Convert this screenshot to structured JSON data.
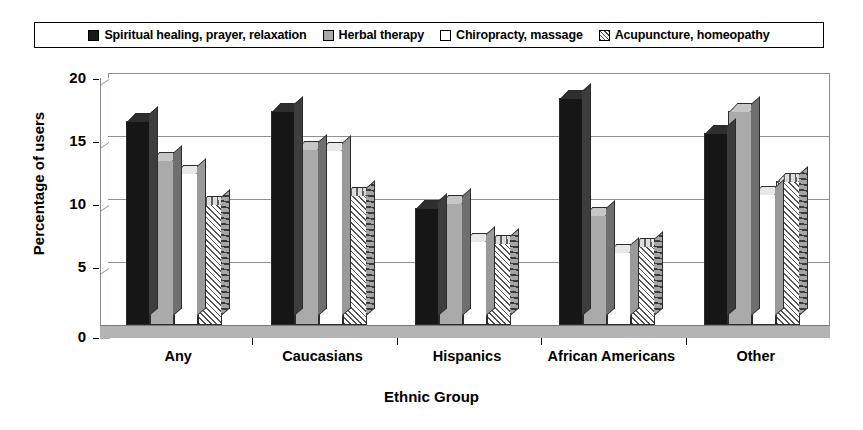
{
  "chart_data": {
    "type": "bar",
    "title": "",
    "xlabel": "Ethnic Group",
    "ylabel": "Percentage of users",
    "categories": [
      "Any",
      "Caucasians",
      "Hispanics",
      "African Americans",
      "Other"
    ],
    "series": [
      {
        "name": "Spiritual healing, prayer, relaxation",
        "swatch": "black",
        "values": [
          16.2,
          17.0,
          9.3,
          18.0,
          15.2
        ]
      },
      {
        "name": "Herbal therapy",
        "swatch": "gray",
        "values": [
          13.1,
          14.0,
          9.7,
          8.7,
          17.0
        ]
      },
      {
        "name": "Chiropracty, massage",
        "swatch": "white",
        "values": [
          12.1,
          13.9,
          6.7,
          5.8,
          10.4
        ]
      },
      {
        "name": "Acupuncture, homeopathy",
        "swatch": "hatch",
        "values": [
          9.6,
          10.3,
          6.5,
          6.3,
          11.4
        ]
      }
    ],
    "ylim": [
      0,
      20
    ],
    "yticks": [
      0,
      5,
      10,
      15,
      20
    ],
    "ytick_labels": [
      "0",
      "5",
      "10",
      "15",
      "20"
    ],
    "grid": true,
    "legend_position": "top",
    "style": "3d-clustered-column",
    "colors": {
      "series1": "#161616",
      "series2": "#aaaaaa",
      "series3": "#ffffff",
      "series4": "#f2f2f2",
      "axis": "#000000",
      "grid": "#8f8f8f",
      "floor": "#b4b4b4",
      "background": "#ffffff"
    }
  },
  "legend": {
    "items": [
      {
        "label": "Spiritual healing, prayer, relaxation",
        "swatch": "black"
      },
      {
        "label": "Herbal therapy",
        "swatch": "gray"
      },
      {
        "label": "Chiropracty, massage",
        "swatch": "white"
      },
      {
        "label": "Acupuncture, homeopathy",
        "swatch": "hatch"
      }
    ]
  }
}
